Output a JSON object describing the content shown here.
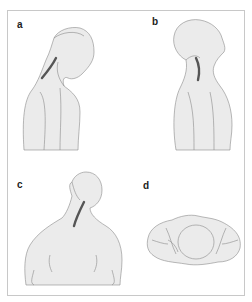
{
  "figure": {
    "panels": [
      {
        "id": "a",
        "label": "a",
        "view": "lateral, neck flexed forward"
      },
      {
        "id": "b",
        "label": "b",
        "view": "lateral, neck extended backward"
      },
      {
        "id": "c",
        "label": "c",
        "view": "posterior, head rotated/tilted"
      },
      {
        "id": "d",
        "label": "d",
        "view": "top-down view of head and shoulders"
      }
    ],
    "colors": {
      "skin": "#ebebeb",
      "outline": "#8a8a8a",
      "spine": "#555555",
      "frame": "#c8c8c8"
    }
  }
}
